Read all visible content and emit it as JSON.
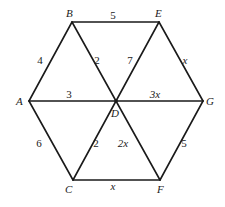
{
  "diagram": {
    "type": "hexagon-graph",
    "vertices": [
      {
        "id": "A",
        "label": "A",
        "x": 29,
        "y": 101,
        "lx": 16,
        "ly": 105
      },
      {
        "id": "B",
        "label": "B",
        "x": 72,
        "y": 22,
        "lx": 66,
        "ly": 17
      },
      {
        "id": "E",
        "label": "E",
        "x": 159,
        "y": 22,
        "lx": 155,
        "ly": 17
      },
      {
        "id": "G",
        "label": "G",
        "x": 203,
        "y": 101,
        "lx": 206,
        "ly": 105
      },
      {
        "id": "F",
        "label": "F",
        "x": 160,
        "y": 180,
        "lx": 157,
        "ly": 193
      },
      {
        "id": "C",
        "label": "C",
        "x": 73,
        "y": 180,
        "lx": 65,
        "ly": 193
      },
      {
        "id": "D",
        "label": "D",
        "x": 116,
        "y": 101,
        "lx": 111,
        "ly": 117
      }
    ],
    "edges": [
      {
        "from": "B",
        "to": "E",
        "weight": "5",
        "lx": 113,
        "ly": 19,
        "var": false
      },
      {
        "from": "A",
        "to": "B",
        "weight": "4",
        "lx": 40,
        "ly": 64,
        "var": false
      },
      {
        "from": "B",
        "to": "D",
        "weight": "2",
        "lx": 97,
        "ly": 64,
        "var": false
      },
      {
        "from": "E",
        "to": "D",
        "weight": "7",
        "lx": 130,
        "ly": 64,
        "var": false
      },
      {
        "from": "E",
        "to": "G",
        "weight": "x",
        "lx": 185,
        "ly": 64,
        "var": true
      },
      {
        "from": "A",
        "to": "D",
        "weight": "3",
        "lx": 69,
        "ly": 98,
        "var": false
      },
      {
        "from": "D",
        "to": "G",
        "weight": "3x",
        "lx": 155,
        "ly": 98,
        "var": true
      },
      {
        "from": "A",
        "to": "C",
        "weight": "6",
        "lx": 39,
        "ly": 147,
        "var": false
      },
      {
        "from": "C",
        "to": "D",
        "weight": "2",
        "lx": 96,
        "ly": 147,
        "var": false
      },
      {
        "from": "D",
        "to": "F",
        "weight": "2x",
        "lx": 123,
        "ly": 147,
        "var": true
      },
      {
        "from": "G",
        "to": "F",
        "weight": "5",
        "lx": 184,
        "ly": 147,
        "var": false
      },
      {
        "from": "C",
        "to": "F",
        "weight": "x",
        "lx": 113,
        "ly": 190,
        "var": true
      }
    ]
  }
}
